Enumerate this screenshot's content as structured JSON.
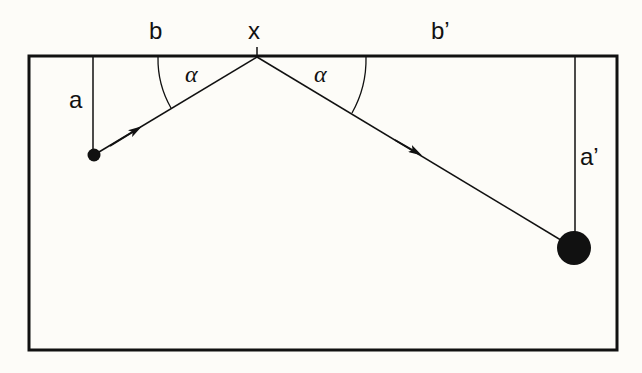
{
  "diagram": {
    "title": "",
    "labels": {
      "b": "b",
      "x": "x",
      "b_prime": "b’",
      "a": "a",
      "a_prime": "a’",
      "alpha_left": "α",
      "alpha_right": "α"
    },
    "colors": {
      "background": "#fdfcf8",
      "ink": "#111111"
    },
    "elements": [
      {
        "id": "table-frame",
        "type": "rectangle",
        "x": 29,
        "y": 56,
        "w": 588,
        "h": 294
      },
      {
        "id": "reflection-point",
        "type": "point",
        "label": "x",
        "x": 257,
        "y": 57
      },
      {
        "id": "small-ball",
        "type": "circle",
        "x": 94,
        "y": 155,
        "r": 6
      },
      {
        "id": "large-ball",
        "type": "circle",
        "x": 574,
        "y": 248,
        "r": 17
      },
      {
        "id": "incoming-path",
        "from": "small-ball",
        "to": "reflection-point"
      },
      {
        "id": "outgoing-path",
        "from": "reflection-point",
        "to": "large-ball"
      },
      {
        "id": "distance-a",
        "label": "a",
        "from": [
          93,
          57
        ],
        "to": [
          93,
          155
        ]
      },
      {
        "id": "distance-a-prime",
        "label": "a’",
        "from": [
          575,
          57
        ],
        "to": [
          575,
          248
        ]
      },
      {
        "id": "angle-left",
        "label": "α"
      },
      {
        "id": "angle-right",
        "label": "α"
      }
    ]
  }
}
